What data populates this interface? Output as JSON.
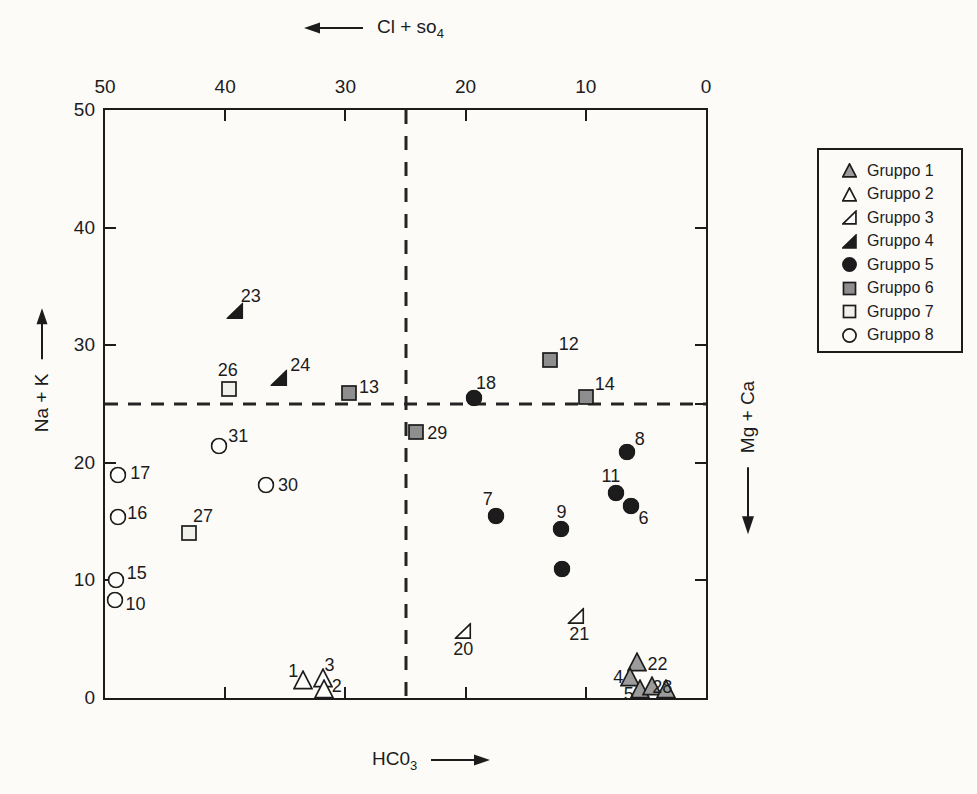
{
  "page": {
    "background": "#fcfbf8",
    "ink": "#1c1c1c"
  },
  "titles": {
    "top": {
      "text": "Cl + so",
      "sub": "4"
    },
    "bottom": {
      "text": "HC0",
      "sub": "3"
    },
    "left": {
      "text": "Na + K"
    },
    "right": {
      "text": "Mg + Ca"
    }
  },
  "chart_data": {
    "type": "scatter",
    "x_axis": {
      "title": "Cl + so4",
      "arrow": "left",
      "min": 0,
      "max": 50,
      "reversed": true,
      "tick_labels": [
        50,
        40,
        30,
        20,
        10,
        0
      ],
      "tick_marks": [
        40,
        30,
        20,
        10
      ]
    },
    "y_axis": {
      "title": "Na + K",
      "arrow": "up",
      "min": 0,
      "max": 50,
      "tick_labels": [
        50,
        40,
        30,
        20,
        10,
        0
      ],
      "tick_marks": [
        40,
        30,
        25,
        20,
        10
      ]
    },
    "x2_axis": {
      "title": "HC03",
      "arrow": "right",
      "tick_marks": [
        40,
        30,
        20,
        10
      ]
    },
    "y2_axis": {
      "title": "Mg + Ca",
      "arrow": "down",
      "tick_marks": [
        40,
        30,
        25,
        20,
        10
      ]
    },
    "reference_lines": {
      "vertical_x": 25,
      "horizontal_y": 25,
      "style": "dashed"
    },
    "groups": [
      {
        "name": "Gruppo 1",
        "marker": "triangle",
        "fill": "#9c9c9c",
        "points": [
          {
            "label": "22",
            "x": 5.7,
            "y": 3.1,
            "lx": 20,
            "ly": 2
          },
          {
            "label": "4",
            "x": 6.3,
            "y": 1.8,
            "lx": -12,
            "ly": 0
          },
          {
            "label": "5",
            "x": 5.5,
            "y": 0.8,
            "lx": -11,
            "ly": 5
          },
          {
            "label": "",
            "x": 4.5,
            "y": 1.0
          },
          {
            "label": "28",
            "x": 3.3,
            "y": 0.8,
            "lx": -4,
            "ly": -2
          }
        ]
      },
      {
        "name": "Gruppo 2",
        "marker": "triangle",
        "fill": "#fdfdfb",
        "points": [
          {
            "label": "1",
            "x": 33.5,
            "y": 1.5,
            "lx": -10,
            "ly": -9
          },
          {
            "label": "3",
            "x": 31.9,
            "y": 1.7,
            "lx": 7,
            "ly": -13
          },
          {
            "label": "2",
            "x": 31.8,
            "y": 0.8,
            "lx": 13,
            "ly": -3
          }
        ]
      },
      {
        "name": "Gruppo 3",
        "marker": "right-triangle",
        "fill": "#fdfdfb",
        "points": [
          {
            "label": "20",
            "x": 20.2,
            "y": 5.7,
            "lx": 0,
            "ly": 18
          },
          {
            "label": "21",
            "x": 10.8,
            "y": 7.0,
            "lx": 3,
            "ly": 18
          }
        ]
      },
      {
        "name": "Gruppo 4",
        "marker": "right-triangle",
        "fill": "#1c1c1c",
        "points": [
          {
            "label": "23",
            "x": 39.2,
            "y": 32.9,
            "lx": 16,
            "ly": -15
          },
          {
            "label": "24",
            "x": 35.5,
            "y": 27.2,
            "lx": 21,
            "ly": -13
          }
        ]
      },
      {
        "name": "Gruppo 5",
        "marker": "circle",
        "fill": "#1c1c1c",
        "points": [
          {
            "label": "18",
            "x": 19.3,
            "y": 25.5,
            "lx": 12,
            "ly": -15
          },
          {
            "label": "8",
            "x": 6.6,
            "y": 20.9,
            "lx": 13,
            "ly": -13
          },
          {
            "label": "11",
            "x": 7.5,
            "y": 17.4,
            "lx": -5,
            "ly": -17
          },
          {
            "label": "6",
            "x": 6.2,
            "y": 16.3,
            "lx": 12,
            "ly": 12
          },
          {
            "label": "7",
            "x": 17.5,
            "y": 15.5,
            "lx": -8,
            "ly": -17
          },
          {
            "label": "9",
            "x": 12.1,
            "y": 14.4,
            "lx": 1,
            "ly": -17
          },
          {
            "label": "",
            "x": 12.0,
            "y": 11.0
          }
        ]
      },
      {
        "name": "Gruppo 6",
        "marker": "square",
        "fill": "#8e8e8e",
        "points": [
          {
            "label": "12",
            "x": 13.0,
            "y": 28.7,
            "lx": 19,
            "ly": -16
          },
          {
            "label": "13",
            "x": 29.7,
            "y": 25.9,
            "lx": 20,
            "ly": -6
          },
          {
            "label": "14",
            "x": 10.0,
            "y": 25.6,
            "lx": 19,
            "ly": -13
          },
          {
            "label": "29",
            "x": 24.1,
            "y": 22.6,
            "lx": 21,
            "ly": 1
          }
        ]
      },
      {
        "name": "Gruppo 7",
        "marker": "square",
        "fill": "#f1f1ec",
        "points": [
          {
            "label": "26",
            "x": 39.7,
            "y": 26.3,
            "lx": -1,
            "ly": -19
          },
          {
            "label": "27",
            "x": 43.0,
            "y": 14.0,
            "lx": 14,
            "ly": -17
          }
        ]
      },
      {
        "name": "Gruppo 8",
        "marker": "circle",
        "fill": "#fdfdfb",
        "points": [
          {
            "label": "31",
            "x": 40.5,
            "y": 21.4,
            "lx": 19,
            "ly": -10
          },
          {
            "label": "17",
            "x": 48.9,
            "y": 19.0,
            "lx": 22,
            "ly": -2
          },
          {
            "label": "30",
            "x": 36.6,
            "y": 18.1,
            "lx": 22,
            "ly": 0
          },
          {
            "label": "16",
            "x": 48.9,
            "y": 15.4,
            "lx": 19,
            "ly": -4
          },
          {
            "label": "15",
            "x": 49.1,
            "y": 10.0,
            "lx": 21,
            "ly": -7
          },
          {
            "label": "10",
            "x": 49.2,
            "y": 8.3,
            "lx": 21,
            "ly": 4
          }
        ]
      }
    ]
  }
}
